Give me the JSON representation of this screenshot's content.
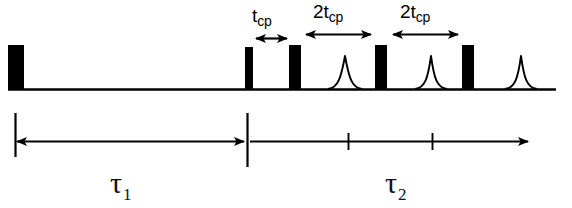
{
  "figure": {
    "background": "#ffffff",
    "ink": "#000000",
    "width": 572,
    "height": 208
  },
  "labels": {
    "tcp": {
      "base": "t",
      "sub": "cp",
      "full": "tcp"
    },
    "two_tcp_first": {
      "base": "2t",
      "sub": "cp",
      "full": "2tcp"
    },
    "two_tcp_second": {
      "base": "2t",
      "sub": "cp",
      "full": "2tcp"
    },
    "tau1": {
      "base": "τ",
      "sub": "1",
      "full": "τ1"
    },
    "tau2": {
      "base": "τ",
      "sub": "2",
      "full": "τ2"
    }
  },
  "pulse_train": {
    "baseline_y": 89,
    "baseline_x_start": 8,
    "baseline_x_end": 556,
    "pulses": [
      {
        "name": "excitation-pulse",
        "x": 8,
        "width": 16,
        "height": 44
      },
      {
        "name": "cp-pulse-1",
        "x": 245,
        "width": 8,
        "height": 42
      },
      {
        "name": "cp-pulse-2",
        "x": 289,
        "width": 12,
        "height": 44
      },
      {
        "name": "cp-pulse-3",
        "x": 375,
        "width": 12,
        "height": 44
      },
      {
        "name": "cp-pulse-4",
        "x": 462,
        "width": 12,
        "height": 44
      }
    ],
    "echoes": [
      {
        "name": "echo-1",
        "center": 345,
        "halfwidth": 17,
        "height": 33
      },
      {
        "name": "echo-2",
        "center": 431,
        "halfwidth": 16,
        "height": 33
      },
      {
        "name": "echo-3",
        "center": 521,
        "halfwidth": 16,
        "height": 33
      }
    ]
  },
  "interval_arrows": [
    {
      "name": "tcp-arrow",
      "x_start": 255,
      "x_end": 288,
      "y": 38,
      "label": "tcp"
    },
    {
      "name": "two-tcp-arrow-1",
      "x_start": 305,
      "x_end": 372,
      "y": 34,
      "label": "2tcp"
    },
    {
      "name": "two-tcp-arrow-2",
      "x_start": 392,
      "x_end": 459,
      "y": 34,
      "label": "2tcp"
    }
  ],
  "time_axis": {
    "y": 141,
    "left_tick": {
      "x": 15,
      "y_top": 113,
      "y_bottom": 157
    },
    "middle_tick": {
      "x": 247,
      "y_top": 113,
      "y_bottom": 167
    },
    "right_arrow_x": 529,
    "tau1_arrow": {
      "x_start": 15,
      "x_end": 245
    },
    "tau2_arrow": {
      "x_start": 249,
      "x_end": 529
    },
    "tau2_ticks": [
      348,
      432
    ]
  }
}
